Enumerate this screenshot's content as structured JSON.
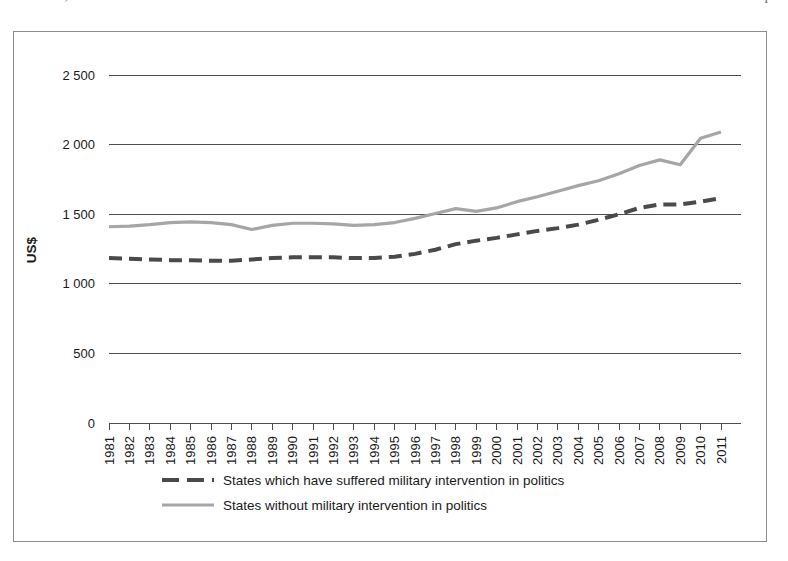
{
  "document": {
    "top_cut_text_left": "Likewise,",
    "top_cut_text_right": "p"
  },
  "chart_data": {
    "type": "line",
    "title": "",
    "xlabel": "",
    "ylabel": "US$",
    "ylim": [
      0,
      2500
    ],
    "yticks": [
      0,
      500,
      1000,
      1500,
      2000,
      2500
    ],
    "ytick_labels": [
      "0",
      "500",
      "1 000",
      "1 500",
      "2 000",
      "2 500"
    ],
    "grid": true,
    "legend_position": "bottom-left",
    "x": [
      1981,
      1982,
      1983,
      1984,
      1985,
      1986,
      1987,
      1988,
      1989,
      1990,
      1991,
      1992,
      1993,
      1994,
      1995,
      1996,
      1997,
      1998,
      1999,
      2000,
      2001,
      2002,
      2003,
      2004,
      2005,
      2006,
      2007,
      2008,
      2009,
      2010,
      2011
    ],
    "categories": [
      "1981",
      "1982",
      "1983",
      "1984",
      "1985",
      "1986",
      "1987",
      "1988",
      "1989",
      "1990",
      "1991",
      "1992",
      "1993",
      "1994",
      "1995",
      "1996",
      "1997",
      "1998",
      "1999",
      "2000",
      "2001",
      "2002",
      "2003",
      "2004",
      "2005",
      "2006",
      "2007",
      "2008",
      "2009",
      "2010",
      "2011"
    ],
    "series": [
      {
        "name": "States which have suffered military intervention in politics",
        "style": "dashed",
        "color": "#4a4a4a",
        "values": [
          1185,
          1180,
          1175,
          1170,
          1170,
          1165,
          1165,
          1175,
          1185,
          1190,
          1190,
          1190,
          1185,
          1185,
          1195,
          1215,
          1245,
          1285,
          1310,
          1330,
          1355,
          1380,
          1400,
          1425,
          1460,
          1500,
          1545,
          1570,
          1570,
          1590,
          1615
        ]
      },
      {
        "name": "States without military intervention in politics",
        "style": "solid",
        "color": "#a6a6a6",
        "values": [
          1410,
          1415,
          1425,
          1440,
          1445,
          1440,
          1425,
          1390,
          1420,
          1435,
          1435,
          1430,
          1420,
          1425,
          1440,
          1470,
          1505,
          1540,
          1520,
          1545,
          1590,
          1625,
          1665,
          1705,
          1740,
          1790,
          1850,
          1890,
          1855,
          2045,
          2090
        ]
      }
    ]
  },
  "legend": {
    "items": [
      {
        "label": "States which have suffered military intervention in politics",
        "color": "#4a4a4a",
        "style": "dashed"
      },
      {
        "label": "States without military intervention in politics",
        "color": "#a6a6a6",
        "style": "solid"
      }
    ]
  }
}
